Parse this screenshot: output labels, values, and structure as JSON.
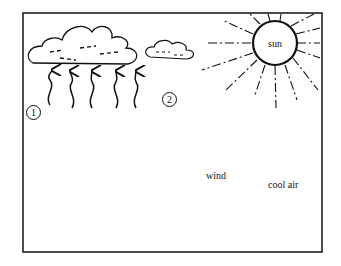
{
  "diagram": {
    "type": "sea-land breeze / convection illustration",
    "labels": {
      "sun": "sun",
      "wind": "wind",
      "cool_air": "cool air",
      "marker_1": "1",
      "marker_2": "2"
    },
    "elements": {
      "clouds": [
        "large cumulus cloud",
        "small cloud"
      ],
      "rising_air_arrows_under_cloud": 5,
      "rising_air_arrows_over_land": 6,
      "wind_arrows_pointing_left": 3,
      "horizontal_lines_left": 2,
      "ground_features": [
        "trees",
        "house",
        "car",
        "hill"
      ]
    },
    "colors": {
      "ink": "#111111",
      "background": "#ffffff"
    }
  }
}
